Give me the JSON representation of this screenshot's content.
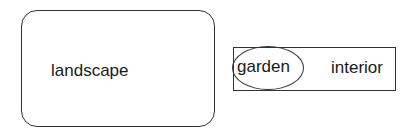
{
  "diagram": {
    "nodes": [
      {
        "id": "landscape",
        "shape": "rounded-rectangle",
        "label": "landscape"
      },
      {
        "id": "interior-container",
        "shape": "rectangle",
        "label": "interior",
        "children": [
          {
            "id": "garden",
            "shape": "ellipse",
            "label": "garden"
          }
        ]
      }
    ],
    "colors": {
      "stroke": "#333333",
      "text": "#1a1a1a",
      "background": "#ffffff"
    }
  }
}
